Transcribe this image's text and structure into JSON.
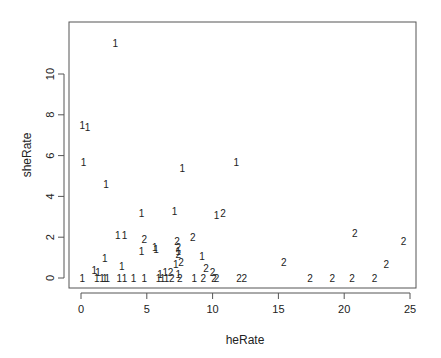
{
  "chart_data": {
    "type": "scatter",
    "title": "",
    "xlabel": "heRate",
    "ylabel": "sheRate",
    "xlim": [
      -0.8,
      25.2
    ],
    "ylim": [
      -0.45,
      11.8
    ],
    "x_ticks": [
      0,
      5,
      10,
      15,
      20,
      25
    ],
    "y_ticks": [
      0,
      2,
      4,
      6,
      8,
      10
    ],
    "grid": false,
    "legend": null,
    "marker": "text labels (group id)",
    "series": [
      {
        "name": "1",
        "points": [
          [
            2.6,
            11.5
          ],
          [
            0.1,
            7.5
          ],
          [
            0.5,
            7.4
          ],
          [
            0.2,
            5.7
          ],
          [
            7.7,
            5.4
          ],
          [
            11.8,
            5.7
          ],
          [
            1.9,
            4.6
          ],
          [
            4.6,
            3.2
          ],
          [
            7.1,
            3.3
          ],
          [
            10.3,
            3.1
          ],
          [
            2.8,
            2.1
          ],
          [
            3.3,
            2.1
          ],
          [
            5.6,
            1.5
          ],
          [
            5.7,
            1.4
          ],
          [
            9.2,
            1.1
          ],
          [
            1.8,
            1.0
          ],
          [
            4.6,
            1.3
          ],
          [
            7.4,
            1.3
          ],
          [
            7.2,
            0.7
          ],
          [
            3.1,
            0.6
          ],
          [
            1.0,
            0.4
          ],
          [
            1.3,
            0.3
          ],
          [
            7.4,
            0.2
          ],
          [
            0.1,
            0.0
          ],
          [
            1.2,
            0.0
          ],
          [
            1.6,
            0.0
          ],
          [
            1.8,
            0.0
          ],
          [
            2.0,
            0.0
          ],
          [
            2.9,
            0.0
          ],
          [
            3.3,
            0.0
          ],
          [
            4.0,
            0.0
          ],
          [
            4.8,
            0.0
          ],
          [
            5.9,
            0.0
          ],
          [
            6.2,
            0.0
          ],
          [
            6.5,
            0.0
          ],
          [
            6.0,
            0.2
          ],
          [
            6.4,
            0.3
          ],
          [
            8.6,
            0.0
          ]
        ]
      },
      {
        "name": "2",
        "points": [
          [
            10.8,
            3.2
          ],
          [
            4.8,
            1.9
          ],
          [
            8.5,
            2.0
          ],
          [
            7.4,
            1.2
          ],
          [
            7.4,
            1.5
          ],
          [
            7.3,
            1.8
          ],
          [
            7.6,
            0.8
          ],
          [
            9.5,
            0.5
          ],
          [
            10.0,
            0.3
          ],
          [
            6.8,
            0.3
          ],
          [
            6.9,
            0.0
          ],
          [
            7.5,
            0.0
          ],
          [
            9.3,
            0.0
          ],
          [
            10.1,
            0.0
          ],
          [
            10.3,
            0.0
          ],
          [
            12.0,
            0.0
          ],
          [
            12.4,
            0.0
          ],
          [
            15.4,
            0.8
          ],
          [
            17.4,
            0.0
          ],
          [
            19.1,
            0.0
          ],
          [
            20.6,
            0.0
          ],
          [
            20.8,
            2.2
          ],
          [
            22.3,
            0.0
          ],
          [
            23.2,
            0.7
          ],
          [
            24.5,
            1.8
          ]
        ]
      }
    ]
  }
}
